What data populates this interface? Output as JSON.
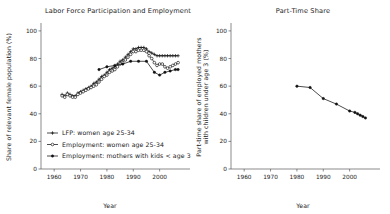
{
  "figure": {
    "background_color": "#ffffff",
    "line_color": "#111111",
    "axis_color": "#5a5a5a"
  },
  "chart_data": [
    {
      "type": "line",
      "panel": "left",
      "title": "Labor Force Participation and Employment",
      "xlabel": "Year",
      "ylabel": "Share of relevant female population (%)",
      "xlim": [
        1955,
        2010
      ],
      "ylim": [
        0,
        105
      ],
      "xticks": [
        1960,
        1970,
        1980,
        1990,
        2000
      ],
      "yticks": [
        0,
        20,
        40,
        60,
        80,
        100
      ],
      "grid": false,
      "legend_position": "lower-left",
      "series": [
        {
          "name": "LFP: women age 25-34",
          "marker": "plus",
          "x": [
            1963,
            1964,
            1965,
            1966,
            1967,
            1968,
            1969,
            1970,
            1971,
            1972,
            1973,
            1974,
            1975,
            1976,
            1977,
            1978,
            1979,
            1980,
            1981,
            1982,
            1983,
            1984,
            1985,
            1986,
            1987,
            1988,
            1989,
            1990,
            1991,
            1992,
            1993,
            1994,
            1995,
            1996,
            1997,
            1998,
            1999,
            2000,
            2001,
            2002,
            2003,
            2004,
            2005,
            2006,
            2007
          ],
          "y": [
            54,
            53,
            55,
            54,
            53,
            53,
            55,
            56,
            57,
            58,
            59,
            60,
            62,
            63,
            65,
            67,
            68,
            70,
            72,
            73,
            74,
            76,
            78,
            79,
            81,
            83,
            85,
            87,
            87,
            88,
            88,
            88,
            87,
            85,
            84,
            83,
            82,
            82,
            82,
            82,
            82,
            82,
            82,
            82,
            82
          ],
          "note": "Topmost curve; rises from ~54 in early 1960s to peak ~88 around 1992-1994 then settles ~82"
        },
        {
          "name": "Employment: women age 25-34",
          "marker": "circle",
          "x": [
            1963,
            1964,
            1965,
            1966,
            1967,
            1968,
            1969,
            1970,
            1971,
            1972,
            1973,
            1974,
            1975,
            1976,
            1977,
            1978,
            1979,
            1980,
            1981,
            1982,
            1983,
            1984,
            1985,
            1986,
            1987,
            1988,
            1989,
            1990,
            1991,
            1992,
            1993,
            1994,
            1995,
            1996,
            1997,
            1998,
            1999,
            2000,
            2001,
            2002,
            2003,
            2004,
            2005,
            2006,
            2007
          ],
          "y": [
            53,
            52,
            54,
            53,
            52,
            52,
            54,
            55,
            56,
            57,
            58,
            59,
            60,
            61,
            63,
            65,
            67,
            68,
            70,
            71,
            72,
            74,
            76,
            77,
            79,
            81,
            83,
            85,
            85,
            86,
            86,
            86,
            85,
            82,
            80,
            77,
            75,
            76,
            76,
            74,
            73,
            74,
            75,
            76,
            77
          ],
          "note": "Middle curve with open-circle markers; peaks ~86 in early 1990s, dips ~73 around 2003, ends ~77"
        },
        {
          "name": "Employment: mothers with kids < age 3",
          "marker": "filled-circle",
          "x": [
            1977,
            1980,
            1983,
            1986,
            1989,
            1992,
            1995,
            1998,
            2000,
            2002,
            2004,
            2006,
            2007
          ],
          "y": [
            72,
            74,
            75,
            76,
            78,
            78,
            78,
            70,
            68,
            70,
            71,
            72,
            72
          ],
          "note": "Lowest curve, starts late 1970s near 72, peaks ~78 late 1980s-90s, drops to ~68 around 2000, ends ~72"
        }
      ]
    },
    {
      "type": "line",
      "panel": "right",
      "title": "Part-Time Share",
      "xlabel": "Year",
      "ylabel": "Part-time share of employed mothers with children under age 3 (%)",
      "ylabel_lines": [
        "Part-time share of employed mothers",
        "with children under age 3 (%)"
      ],
      "xlim": [
        1955,
        2010
      ],
      "ylim": [
        0,
        105
      ],
      "xticks": [
        1960,
        1970,
        1980,
        1990,
        2000
      ],
      "yticks": [
        0,
        20,
        40,
        60,
        80,
        100
      ],
      "grid": false,
      "series": [
        {
          "name": "Part-time share",
          "marker": "filled-circle",
          "x": [
            1980,
            1985,
            1990,
            1995,
            2000,
            2002,
            2003,
            2004,
            2005,
            2006
          ],
          "y": [
            60,
            59,
            51,
            47,
            42,
            41,
            40,
            39,
            38,
            37
          ],
          "note": "Single declining series from ~60% in 1980 to ~37% by mid-2000s"
        }
      ]
    }
  ],
  "left_chart": {
    "title": "Labor Force Participation and Employment",
    "ylabel": "Share of relevant female population (%)",
    "xlabel": "Year",
    "xticks": [
      "1960",
      "1970",
      "1980",
      "1990",
      "2000"
    ],
    "yticks": [
      "0",
      "20",
      "40",
      "60",
      "80",
      "100"
    ],
    "legend": [
      {
        "label": "LFP: women age 25-34",
        "marker": "plus"
      },
      {
        "label": "Employment: women age 25-34",
        "marker": "circle"
      },
      {
        "label": "Employment: mothers with kids < age 3",
        "marker": "filled-circle"
      }
    ]
  },
  "right_chart": {
    "title": "Part-Time Share",
    "ylabel_line1": "Part-time share of employed mothers",
    "ylabel_line2": "with children under age 3 (%)",
    "xlabel": "Year",
    "xticks": [
      "1960",
      "1970",
      "1980",
      "1990",
      "2000"
    ],
    "yticks": [
      "0",
      "20",
      "40",
      "60",
      "80",
      "100"
    ]
  }
}
